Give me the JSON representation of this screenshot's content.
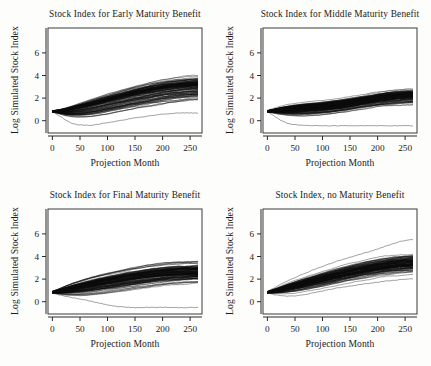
{
  "figure": {
    "background_color": "#fdfdfc",
    "ink_color": "#0a0a0a",
    "layout": "2x2 panel grid"
  },
  "panels": [
    {
      "id": "early-maturity",
      "title": "Stock Index for Early Maturity Benefit",
      "xlabel": "Projection Month",
      "ylabel": "Log Simulated Stock Index"
    },
    {
      "id": "middle-maturity",
      "title": "Stock Index for Middle Maturity Benefit",
      "xlabel": "Projection Month",
      "ylabel": "Log Simulated Stock Index"
    },
    {
      "id": "final-maturity",
      "title": "Stock Index for Final Maturity Benefit",
      "xlabel": "Projection Month",
      "ylabel": "Log Simulated Stock Index"
    },
    {
      "id": "no-maturity",
      "title": "Stock Index, no Maturity Benefit",
      "xlabel": "Projection Month",
      "ylabel": "Log Simulated Stock Index"
    }
  ],
  "chart_data": [
    {
      "type": "line",
      "panel_id": "early-maturity",
      "title": "Stock Index for Early Maturity Benefit",
      "xlabel": "Projection Month",
      "ylabel": "Log Simulated Stock Index",
      "xlim": [
        -8,
        272
      ],
      "ylim": [
        -1.9,
        7.4
      ],
      "xticks": [
        0,
        50,
        100,
        150,
        200,
        250
      ],
      "yticks": [
        0,
        2,
        4,
        6
      ],
      "xtick_labels": [
        "0",
        "50",
        "100",
        "150",
        "200",
        "250"
      ],
      "ytick_labels": [
        "0",
        "2",
        "4",
        "6"
      ],
      "grid": false,
      "legend": "none",
      "n_paths": 110,
      "x": [
        0,
        12,
        24,
        36,
        48,
        60,
        72,
        84,
        96,
        108,
        120,
        132,
        144,
        156,
        168,
        180,
        192,
        204,
        216,
        228,
        240,
        252,
        264
      ],
      "envelope_upper": [
        0.1,
        0.22,
        0.4,
        0.62,
        0.85,
        1.05,
        1.28,
        1.5,
        1.72,
        1.92,
        2.1,
        2.28,
        2.46,
        2.64,
        2.8,
        2.96,
        3.08,
        3.2,
        3.3,
        3.38,
        3.44,
        3.48,
        3.5
      ],
      "envelope_median": [
        0.02,
        0.05,
        0.12,
        0.22,
        0.34,
        0.46,
        0.6,
        0.74,
        0.88,
        1.02,
        1.16,
        1.3,
        1.44,
        1.56,
        1.68,
        1.8,
        1.9,
        2.0,
        2.08,
        2.14,
        2.2,
        2.24,
        2.26
      ],
      "envelope_lower": [
        -0.06,
        -0.28,
        -0.55,
        -0.72,
        -0.82,
        -0.86,
        -0.84,
        -0.78,
        -0.7,
        -0.6,
        -0.5,
        -0.4,
        -0.3,
        -0.2,
        -0.1,
        0.0,
        0.1,
        0.2,
        0.3,
        0.38,
        0.46,
        0.52,
        0.58
      ],
      "outlier_low": [
        -0.05,
        -0.35,
        -0.75,
        -1.05,
        -1.18,
        -1.22,
        -1.2,
        -1.12,
        -1.02,
        -0.92,
        -0.82,
        -0.72,
        -0.62,
        -0.52,
        -0.44,
        -0.36,
        -0.28,
        -0.22,
        -0.18,
        -0.14,
        -0.12,
        -0.12,
        -0.14
      ],
      "description": "Dense bundle of ~110 simulated log stock index paths starting near 0, fanning upward; bulk spans roughly -0.4 to 3.5 at month 264, with one low outlier near -1.2 between months 36 and 96."
    },
    {
      "type": "line",
      "panel_id": "middle-maturity",
      "title": "Stock Index for Middle Maturity Benefit",
      "xlabel": "Projection Month",
      "ylabel": "Log Simulated Stock Index",
      "xlim": [
        -8,
        272
      ],
      "ylim": [
        -1.9,
        7.4
      ],
      "xticks": [
        0,
        50,
        100,
        150,
        200,
        250
      ],
      "yticks": [
        0,
        2,
        4,
        6
      ],
      "xtick_labels": [
        "0",
        "50",
        "100",
        "150",
        "200",
        "250"
      ],
      "ytick_labels": [
        "0",
        "2",
        "4",
        "6"
      ],
      "grid": false,
      "legend": "none",
      "n_paths": 110,
      "x": [
        0,
        12,
        24,
        36,
        48,
        60,
        72,
        84,
        96,
        108,
        120,
        132,
        144,
        156,
        168,
        180,
        192,
        204,
        216,
        228,
        240,
        252,
        264
      ],
      "envelope_upper": [
        0.12,
        0.32,
        0.52,
        0.68,
        0.8,
        0.9,
        0.98,
        1.04,
        1.1,
        1.16,
        1.22,
        1.28,
        1.36,
        1.44,
        1.54,
        1.64,
        1.74,
        1.84,
        1.92,
        1.98,
        2.02,
        2.06,
        2.08
      ],
      "envelope_median": [
        0.02,
        0.06,
        0.12,
        0.16,
        0.2,
        0.24,
        0.28,
        0.32,
        0.36,
        0.42,
        0.5,
        0.58,
        0.68,
        0.78,
        0.88,
        0.98,
        1.08,
        1.18,
        1.26,
        1.32,
        1.38,
        1.42,
        1.44
      ],
      "envelope_lower": [
        -0.08,
        -0.26,
        -0.44,
        -0.58,
        -0.66,
        -0.7,
        -0.7,
        -0.68,
        -0.64,
        -0.58,
        -0.5,
        -0.42,
        -0.34,
        -0.26,
        -0.18,
        -0.1,
        -0.02,
        0.06,
        0.12,
        0.18,
        0.22,
        0.26,
        0.28
      ],
      "outlier_low": [
        -0.06,
        -0.38,
        -0.78,
        -1.05,
        -1.16,
        -1.2,
        -1.22,
        -1.24,
        -1.26,
        -1.26,
        -1.26,
        -1.26,
        -1.26,
        -1.26,
        -1.26,
        -1.26,
        -1.26,
        -1.26,
        -1.26,
        -1.26,
        -1.26,
        -1.26,
        -1.26
      ],
      "description": "Flatter, more compressed bundle than the early-maturity panel; bulk rises only to about 2 by month 264, with a persistent low outlier hugging -1.25 from month 60 onward."
    },
    {
      "type": "line",
      "panel_id": "final-maturity",
      "title": "Stock Index for Final Maturity Benefit",
      "xlabel": "Projection Month",
      "ylabel": "Log Simulated Stock Index",
      "xlim": [
        -8,
        272
      ],
      "ylim": [
        -1.9,
        7.4
      ],
      "xticks": [
        0,
        50,
        100,
        150,
        200,
        250
      ],
      "yticks": [
        0,
        2,
        4,
        6
      ],
      "xtick_labels": [
        "0",
        "50",
        "100",
        "150",
        "200",
        "250"
      ],
      "ytick_labels": [
        "0",
        "2",
        "4",
        "6"
      ],
      "grid": false,
      "legend": "none",
      "n_paths": 110,
      "x": [
        0,
        12,
        24,
        36,
        48,
        60,
        72,
        84,
        96,
        108,
        120,
        132,
        144,
        156,
        168,
        180,
        192,
        204,
        216,
        228,
        240,
        252,
        264
      ],
      "envelope_upper": [
        0.14,
        0.42,
        0.72,
        0.98,
        1.2,
        1.4,
        1.58,
        1.74,
        1.9,
        2.04,
        2.18,
        2.32,
        2.44,
        2.56,
        2.66,
        2.74,
        2.82,
        2.88,
        2.92,
        2.96,
        2.98,
        3.0,
        3.0
      ],
      "envelope_median": [
        0.04,
        0.14,
        0.28,
        0.42,
        0.54,
        0.66,
        0.78,
        0.9,
        1.0,
        1.1,
        1.2,
        1.3,
        1.4,
        1.48,
        1.56,
        1.64,
        1.7,
        1.76,
        1.8,
        1.84,
        1.86,
        1.88,
        1.9
      ],
      "envelope_lower": [
        -0.08,
        -0.22,
        -0.36,
        -0.46,
        -0.52,
        -0.54,
        -0.52,
        -0.48,
        -0.42,
        -0.34,
        -0.26,
        -0.18,
        -0.1,
        -0.02,
        0.06,
        0.14,
        0.22,
        0.3,
        0.36,
        0.42,
        0.46,
        0.5,
        0.52
      ],
      "outlier_low": [
        -0.06,
        -0.2,
        -0.34,
        -0.46,
        -0.56,
        -0.66,
        -0.78,
        -0.92,
        -1.05,
        -1.16,
        -1.24,
        -1.3,
        -1.32,
        -1.33,
        -1.33,
        -1.32,
        -1.32,
        -1.32,
        -1.32,
        -1.33,
        -1.33,
        -1.33,
        -1.33
      ],
      "description": "Broad upward-fanning bundle reaching about 3 at month 264, with a single outlier path descending after month 96 and flattening near -1.3."
    },
    {
      "type": "line",
      "panel_id": "no-maturity",
      "title": "Stock Index, no Maturity Benefit",
      "xlabel": "Projection Month",
      "ylabel": "Log Simulated Stock Index",
      "xlim": [
        -8,
        272
      ],
      "ylim": [
        -1.9,
        7.4
      ],
      "xticks": [
        0,
        50,
        100,
        150,
        200,
        250
      ],
      "yticks": [
        0,
        2,
        4,
        6
      ],
      "xtick_labels": [
        "0",
        "50",
        "100",
        "150",
        "200",
        "250"
      ],
      "ytick_labels": [
        "0",
        "2",
        "4",
        "6"
      ],
      "grid": false,
      "legend": "none",
      "n_paths": 110,
      "x": [
        0,
        12,
        24,
        36,
        48,
        60,
        72,
        84,
        96,
        108,
        120,
        132,
        144,
        156,
        168,
        180,
        192,
        204,
        216,
        228,
        240,
        252,
        264
      ],
      "envelope_upper": [
        0.12,
        0.36,
        0.62,
        0.88,
        1.1,
        1.32,
        1.52,
        1.72,
        1.92,
        2.1,
        2.28,
        2.46,
        2.62,
        2.78,
        2.92,
        3.06,
        3.18,
        3.28,
        3.38,
        3.46,
        3.52,
        3.56,
        3.6
      ],
      "envelope_median": [
        0.03,
        0.14,
        0.28,
        0.44,
        0.58,
        0.72,
        0.88,
        1.02,
        1.16,
        1.3,
        1.44,
        1.58,
        1.72,
        1.84,
        1.96,
        2.08,
        2.18,
        2.28,
        2.36,
        2.44,
        2.5,
        2.54,
        2.58
      ],
      "envelope_lower": [
        -0.08,
        -0.14,
        -0.18,
        -0.18,
        -0.14,
        -0.08,
        0.0,
        0.1,
        0.2,
        0.32,
        0.44,
        0.56,
        0.68,
        0.8,
        0.92,
        1.02,
        1.12,
        1.22,
        1.3,
        1.38,
        1.44,
        1.5,
        1.54
      ],
      "outlier_high": [
        0.1,
        0.4,
        0.72,
        1.02,
        1.28,
        1.54,
        1.78,
        2.02,
        2.24,
        2.46,
        2.66,
        2.86,
        3.04,
        3.22,
        3.38,
        3.54,
        3.72,
        3.92,
        4.12,
        4.32,
        4.5,
        4.62,
        4.7
      ],
      "outlier_low": [
        -0.04,
        -0.18,
        -0.28,
        -0.32,
        -0.3,
        -0.24,
        -0.14,
        -0.02,
        0.1,
        0.22,
        0.34,
        0.44,
        0.54,
        0.62,
        0.7,
        0.78,
        0.86,
        0.94,
        1.02,
        1.08,
        1.14,
        1.18,
        1.22
      ],
      "description": "Tightest and steepest bundle with no truncation from benefit payouts; paths climb steadily to about 3.6 by month 264 with a top outlier reaching roughly 4.7."
    }
  ]
}
